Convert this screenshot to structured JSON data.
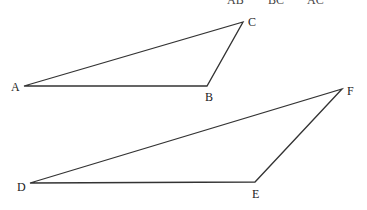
{
  "header": {
    "terms": [
      "AB",
      "BC",
      "AC"
    ]
  },
  "triangles": [
    {
      "name": "ABC",
      "vertices": [
        {
          "label": "A",
          "x": 24,
          "y": 86,
          "lx": 11,
          "ly": 91
        },
        {
          "label": "B",
          "x": 207,
          "y": 86,
          "lx": 205,
          "ly": 101
        },
        {
          "label": "C",
          "x": 243,
          "y": 22,
          "lx": 248,
          "ly": 26
        }
      ]
    },
    {
      "name": "DEF",
      "vertices": [
        {
          "label": "D",
          "x": 30,
          "y": 183,
          "lx": 17,
          "ly": 191
        },
        {
          "label": "E",
          "x": 255,
          "y": 182,
          "lx": 252,
          "ly": 198
        },
        {
          "label": "F",
          "x": 342,
          "y": 89,
          "lx": 347,
          "ly": 95
        }
      ]
    }
  ],
  "colors": {
    "stroke": "#333333",
    "text": "#222222"
  }
}
